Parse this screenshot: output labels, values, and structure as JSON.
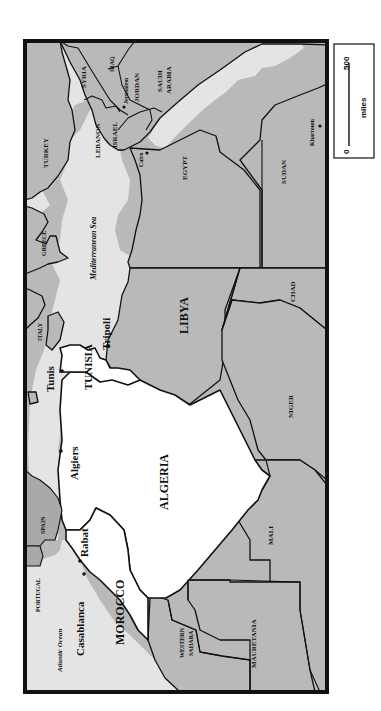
{
  "map": {
    "title": "North Africa and the Middle East",
    "orientation": "rotated 90 degrees counter-clockwise",
    "colors": {
      "sea": "#e4e4e4",
      "land": "#b9b9b9",
      "highlighted_countries": "#ffffff",
      "borders": "#111111"
    },
    "highlighted_countries": [
      "MOROCCO",
      "ALGERIA",
      "TUNISIA",
      "LIBYA"
    ],
    "countries": {
      "morocco": "MOROCCO",
      "algeria": "ALGERIA",
      "tunisia": "TUNISIA",
      "libya": "LIBYA",
      "egypt": "EGYPT",
      "sudan": "SUDAN",
      "chad": "CHAD",
      "niger": "NIGER",
      "mali": "MALI",
      "mauretania": "MAURETANIA",
      "western_sahara_1": "WESTERN",
      "western_sahara_2": "SAHARA",
      "spain": "SPAIN",
      "portugal": "PORTUGAL",
      "italy": "ITALY",
      "greece": "GREECE",
      "turkey": "TURKEY",
      "syria": "SYRIA",
      "iraq": "IRAQ",
      "lebanon": "LEBANON",
      "israel": "ISRAEL",
      "jordan": "JORDAN",
      "saudi_1": "SAUDI",
      "saudi_2": "ARABIA"
    },
    "water_bodies": {
      "atlantic": "Atlantic Ocean",
      "mediterranean": "Mediterranean Sea"
    },
    "cities": {
      "casablanca": "Casablanca",
      "rabat": "Rabat",
      "algiers": "Algiers",
      "tunis": "Tunis",
      "tripoli": "Tripoli",
      "cairo": "Cairo",
      "jerusalem": "Jerusalem",
      "khartoum": "Khartoum"
    },
    "scale": {
      "start": "0",
      "end": "500",
      "unit": "miles"
    }
  }
}
